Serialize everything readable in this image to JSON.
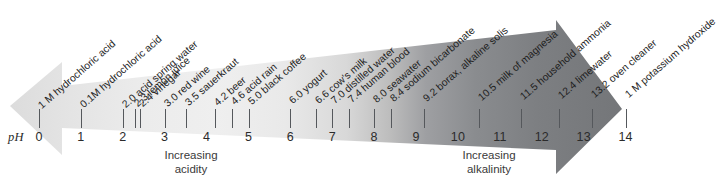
{
  "diagram": {
    "type": "ph-scale",
    "axis_label": "pH",
    "axis_ticks_major": [
      0,
      1,
      2,
      3,
      4,
      5,
      6,
      7,
      8,
      9,
      10,
      11,
      12,
      13,
      14
    ],
    "axis_min": 0,
    "axis_max": 14,
    "captions": {
      "acidity": "Increasing\nacidity",
      "acidity_line1": "Increasing",
      "acidity_line2": "acidity",
      "alkalinity_line1": "Increasing",
      "alkalinity_line2": "alkalinity"
    },
    "colors": {
      "acid_end": "#eeeeee",
      "neutral": "#d8d8d8",
      "alkaline_end": "#77797c",
      "tick": "#55585c",
      "text": "#1d1d1d"
    }
  },
  "chart_data": {
    "type": "scatter",
    "title": "",
    "xlabel": "pH",
    "ylabel": "",
    "xlim": [
      0,
      14
    ],
    "grid": false,
    "legend": "none",
    "categories": [
      "1 M hydrochloric acid",
      "0.1M hydrochloric acid",
      "2.0 acid spring water",
      "2.3 lemon juice",
      "2.4 vinegar",
      "3.0 red wine",
      "3.5 sauerkraut",
      "4.2 beer",
      "4.6 acid rain",
      "5.0 black coffee",
      "6.0 yogurt",
      "6.6 cow's milk",
      "7.0 distilled water",
      "7.4 human blood",
      "8.0 seawater",
      "8.4 sodium bicarbonate",
      "9.2 borax, alkaline solis",
      "10.5 milk of magnesia",
      "11.5 household ammonia",
      "12.4 limewater",
      "13.2 oven cleaner",
      "1 M potassium hydroxide"
    ],
    "values": [
      0.0,
      1.0,
      2.0,
      2.3,
      2.4,
      3.0,
      3.5,
      4.2,
      4.6,
      5.0,
      6.0,
      6.6,
      7.0,
      7.4,
      8.0,
      8.4,
      9.2,
      10.5,
      11.5,
      12.4,
      13.2,
      14.0
    ],
    "points": [
      {
        "ph": 0.0,
        "label": "1 M hydrochloric acid"
      },
      {
        "ph": 1.0,
        "label": "0.1M hydrochloric acid"
      },
      {
        "ph": 2.0,
        "label": "2.0 acid spring water"
      },
      {
        "ph": 2.3,
        "label": "2.3 lemon juice"
      },
      {
        "ph": 2.4,
        "label": "2.4 vinegar"
      },
      {
        "ph": 3.0,
        "label": "3.0 red wine"
      },
      {
        "ph": 3.5,
        "label": "3.5 sauerkraut"
      },
      {
        "ph": 4.2,
        "label": "4.2 beer"
      },
      {
        "ph": 4.6,
        "label": "4.6 acid rain"
      },
      {
        "ph": 5.0,
        "label": "5.0 black coffee"
      },
      {
        "ph": 6.0,
        "label": "6.0 yogurt"
      },
      {
        "ph": 6.6,
        "label": "6.6 cow's milk"
      },
      {
        "ph": 7.0,
        "label": "7.0 distilled water"
      },
      {
        "ph": 7.4,
        "label": "7.4 human blood"
      },
      {
        "ph": 8.0,
        "label": "8.0 seawater"
      },
      {
        "ph": 8.4,
        "label": "8.4 sodium bicarbonate"
      },
      {
        "ph": 9.2,
        "label": "9.2 borax, alkaline solis"
      },
      {
        "ph": 10.5,
        "label": "10.5 milk of magnesia"
      },
      {
        "ph": 11.5,
        "label": "11.5 household ammonia"
      },
      {
        "ph": 12.4,
        "label": "12.4 limewater"
      },
      {
        "ph": 13.2,
        "label": "13.2 oven cleaner"
      },
      {
        "ph": 14.0,
        "label": "1 M potassium hydroxide"
      }
    ],
    "tick_labels": [
      "0",
      "1",
      "2",
      "3",
      "4",
      "5",
      "6",
      "7",
      "8",
      "9",
      "10",
      "11",
      "12",
      "13",
      "14"
    ]
  }
}
